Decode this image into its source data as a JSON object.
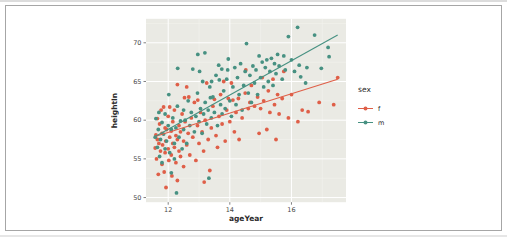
{
  "figure": {
    "border_color": "#a6a6a6",
    "background": "#ffffff"
  },
  "chart_data": {
    "type": "scatter",
    "title": "",
    "xlabel": "ageYear",
    "ylabel": "heightIn",
    "xlim": [
      11.28,
      17.77
    ],
    "ylim": [
      49.4,
      73.1
    ],
    "x_ticks": [
      12,
      14,
      16
    ],
    "y_ticks": [
      50,
      55,
      60,
      65,
      70
    ],
    "x_minor_ticks": [
      13,
      15,
      17
    ],
    "y_minor_ticks": [
      52.5,
      57.5,
      62.5,
      67.5,
      72.5
    ],
    "grid": true,
    "panel_bg": "#eaeae4",
    "grid_major_color": "#ffffff",
    "grid_minor_color": "#f4f4ef",
    "legend": {
      "title": "sex",
      "position": "right",
      "entries": [
        {
          "label": "f",
          "color": "#df5f48"
        },
        {
          "label": "m",
          "color": "#479182"
        }
      ]
    },
    "series": [
      {
        "name": "f",
        "color": "#df5f48",
        "fit_line": {
          "x": [
            11.58,
            17.5
          ],
          "y": [
            57.9,
            65.3
          ]
        },
        "points": [
          [
            11.58,
            56.4
          ],
          [
            11.6,
            58.1
          ],
          [
            11.62,
            55.0
          ],
          [
            11.65,
            57.5
          ],
          [
            11.65,
            60.2
          ],
          [
            11.68,
            53.0
          ],
          [
            11.7,
            57.0
          ],
          [
            11.72,
            59.5
          ],
          [
            11.75,
            56.0
          ],
          [
            11.77,
            61.3
          ],
          [
            11.8,
            54.3
          ],
          [
            11.8,
            58.3
          ],
          [
            11.82,
            56.8
          ],
          [
            11.85,
            61.7
          ],
          [
            11.87,
            53.3
          ],
          [
            11.9,
            55.8
          ],
          [
            11.9,
            59.0
          ],
          [
            11.92,
            57.3
          ],
          [
            11.93,
            51.3
          ],
          [
            11.95,
            58.8
          ],
          [
            12.0,
            56.3
          ],
          [
            12.0,
            60.5
          ],
          [
            12.02,
            54.8
          ],
          [
            12.05,
            57.8
          ],
          [
            12.05,
            61.7
          ],
          [
            12.1,
            55.5
          ],
          [
            12.1,
            58.6
          ],
          [
            12.12,
            52.8
          ],
          [
            12.15,
            57.0
          ],
          [
            12.15,
            59.8
          ],
          [
            12.2,
            56.5
          ],
          [
            12.2,
            61.3
          ],
          [
            12.25,
            54.5
          ],
          [
            12.25,
            58.0
          ],
          [
            12.3,
            52.2
          ],
          [
            12.3,
            57.5
          ],
          [
            12.3,
            64.6
          ],
          [
            12.35,
            56.0
          ],
          [
            12.35,
            59.3
          ],
          [
            12.4,
            55.3
          ],
          [
            12.4,
            58.5
          ],
          [
            12.45,
            60.8
          ],
          [
            12.5,
            54.0
          ],
          [
            12.5,
            57.3
          ],
          [
            12.53,
            62.9
          ],
          [
            12.55,
            59.8
          ],
          [
            12.6,
            56.8
          ],
          [
            12.6,
            64.3
          ],
          [
            12.65,
            58.3
          ],
          [
            12.67,
            63.0
          ],
          [
            12.7,
            55.5
          ],
          [
            12.75,
            60.3
          ],
          [
            12.8,
            57.8
          ],
          [
            12.85,
            62.3
          ],
          [
            12.9,
            54.8
          ],
          [
            12.95,
            59.3
          ],
          [
            12.96,
            62.6
          ],
          [
            13.0,
            57.0
          ],
          [
            13.05,
            61.0
          ],
          [
            13.1,
            58.5
          ],
          [
            13.15,
            56.0
          ],
          [
            13.17,
            52.0
          ],
          [
            13.2,
            60.0
          ],
          [
            13.25,
            64.8
          ],
          [
            13.3,
            57.5
          ],
          [
            13.35,
            53.5
          ],
          [
            13.4,
            59.0
          ],
          [
            13.45,
            61.8
          ],
          [
            13.5,
            62.7
          ],
          [
            13.55,
            58.0
          ],
          [
            13.6,
            56.5
          ],
          [
            13.65,
            60.5
          ],
          [
            13.7,
            63.3
          ],
          [
            13.75,
            59.5
          ],
          [
            13.8,
            65.0
          ],
          [
            13.85,
            57.3
          ],
          [
            13.9,
            61.3
          ],
          [
            13.95,
            62.8
          ],
          [
            14.0,
            59.8
          ],
          [
            14.05,
            64.8
          ],
          [
            14.1,
            62.6
          ],
          [
            14.15,
            58.5
          ],
          [
            14.2,
            61.0
          ],
          [
            14.28,
            62.8
          ],
          [
            14.3,
            57.5
          ],
          [
            14.4,
            60.3
          ],
          [
            14.5,
            63.5
          ],
          [
            14.52,
            66.5
          ],
          [
            14.6,
            61.5
          ],
          [
            14.65,
            62.3
          ],
          [
            14.7,
            64.5
          ],
          [
            14.8,
            61.8
          ],
          [
            14.9,
            63.0
          ],
          [
            14.95,
            58.3
          ],
          [
            15.0,
            61.5
          ],
          [
            15.05,
            65.5
          ],
          [
            15.1,
            62.5
          ],
          [
            15.2,
            58.8
          ],
          [
            15.25,
            63.8
          ],
          [
            15.3,
            61.0
          ],
          [
            15.4,
            65.3
          ],
          [
            15.45,
            62.0
          ],
          [
            15.5,
            57.5
          ],
          [
            15.55,
            63.3
          ],
          [
            15.6,
            60.8
          ],
          [
            15.7,
            62.8
          ],
          [
            15.75,
            66.3
          ],
          [
            15.9,
            60.3
          ],
          [
            16.0,
            63.3
          ],
          [
            16.21,
            59.8
          ],
          [
            16.35,
            61.3
          ],
          [
            16.54,
            61.1
          ],
          [
            16.9,
            62.3
          ],
          [
            17.37,
            62.0
          ],
          [
            17.5,
            65.5
          ]
        ]
      },
      {
        "name": "m",
        "color": "#479182",
        "fit_line": {
          "x": [
            11.58,
            17.5
          ],
          "y": [
            57.9,
            71.0
          ]
        },
        "points": [
          [
            11.58,
            57.8
          ],
          [
            11.6,
            60.2
          ],
          [
            11.65,
            56.5
          ],
          [
            11.68,
            58.8
          ],
          [
            11.7,
            61.0
          ],
          [
            11.72,
            55.3
          ],
          [
            11.75,
            57.5
          ],
          [
            11.8,
            59.7
          ],
          [
            11.8,
            54.5
          ],
          [
            11.85,
            58.2
          ],
          [
            11.9,
            56.3
          ],
          [
            11.9,
            60.8
          ],
          [
            11.95,
            57.3
          ],
          [
            12.0,
            59.3
          ],
          [
            12.02,
            63.3
          ],
          [
            12.05,
            55.8
          ],
          [
            12.1,
            58.8
          ],
          [
            12.1,
            53.2
          ],
          [
            12.15,
            60.3
          ],
          [
            12.2,
            57.0
          ],
          [
            12.2,
            55.0
          ],
          [
            12.25,
            59.0
          ],
          [
            12.27,
            50.6
          ],
          [
            12.3,
            61.8
          ],
          [
            12.31,
            66.7
          ],
          [
            12.35,
            57.8
          ],
          [
            12.4,
            59.9
          ],
          [
            12.45,
            56.3
          ],
          [
            12.5,
            58.8
          ],
          [
            12.5,
            61.3
          ],
          [
            12.55,
            60.0
          ],
          [
            12.6,
            57.0
          ],
          [
            12.65,
            62.5
          ],
          [
            12.7,
            59.3
          ],
          [
            12.75,
            61.0
          ],
          [
            12.8,
            66.6
          ],
          [
            12.85,
            58.5
          ],
          [
            12.9,
            60.5
          ],
          [
            12.95,
            63.5
          ],
          [
            12.96,
            68.5
          ],
          [
            13.0,
            59.8
          ],
          [
            13.02,
            66.3
          ],
          [
            13.05,
            61.5
          ],
          [
            13.1,
            58.3
          ],
          [
            13.12,
            65.0
          ],
          [
            13.15,
            60.8
          ],
          [
            13.19,
            68.7
          ],
          [
            13.2,
            62.3
          ],
          [
            13.25,
            59.5
          ],
          [
            13.3,
            61.3
          ],
          [
            13.32,
            52.5
          ],
          [
            13.35,
            64.3
          ],
          [
            13.37,
            62.9
          ],
          [
            13.4,
            60.3
          ],
          [
            13.41,
            65.0
          ],
          [
            13.45,
            63.0
          ],
          [
            13.5,
            61.0
          ],
          [
            13.55,
            65.8
          ],
          [
            13.6,
            59.3
          ],
          [
            13.64,
            67.1
          ],
          [
            13.66,
            65.2
          ],
          [
            13.7,
            62.0
          ],
          [
            13.74,
            66.6
          ],
          [
            13.75,
            60.8
          ],
          [
            13.8,
            63.8
          ],
          [
            13.85,
            61.5
          ],
          [
            13.9,
            65.3
          ],
          [
            13.93,
            66.5
          ],
          [
            13.95,
            67.9
          ],
          [
            14.0,
            62.5
          ],
          [
            14.05,
            60.5
          ],
          [
            14.1,
            64.3
          ],
          [
            14.16,
            66.8
          ],
          [
            14.2,
            62.0
          ],
          [
            14.25,
            65.5
          ],
          [
            14.3,
            63.3
          ],
          [
            14.35,
            67.3
          ],
          [
            14.4,
            61.3
          ],
          [
            14.45,
            64.5
          ],
          [
            14.5,
            66.3
          ],
          [
            14.54,
            69.9
          ],
          [
            14.6,
            63.5
          ],
          [
            14.65,
            65.8
          ],
          [
            14.7,
            62.3
          ],
          [
            14.75,
            67.0
          ],
          [
            14.8,
            64.8
          ],
          [
            14.85,
            66.5
          ],
          [
            14.9,
            63.3
          ],
          [
            14.95,
            68.3
          ],
          [
            15.0,
            65.5
          ],
          [
            15.05,
            67.5
          ],
          [
            15.1,
            64.3
          ],
          [
            15.15,
            66.8
          ],
          [
            15.2,
            67.8
          ],
          [
            15.25,
            65.0
          ],
          [
            15.3,
            66.3
          ],
          [
            15.35,
            68.0
          ],
          [
            15.4,
            64.5
          ],
          [
            15.45,
            67.3
          ],
          [
            15.5,
            66.0
          ],
          [
            15.55,
            68.5
          ],
          [
            15.6,
            67.0
          ],
          [
            15.7,
            65.3
          ],
          [
            15.75,
            68.3
          ],
          [
            15.8,
            66.5
          ],
          [
            15.9,
            70.8
          ],
          [
            16.0,
            67.8
          ],
          [
            16.1,
            66.3
          ],
          [
            16.2,
            72.0
          ],
          [
            16.25,
            67.1
          ],
          [
            16.3,
            65.6
          ],
          [
            16.46,
            64.8
          ],
          [
            16.5,
            66.8
          ],
          [
            16.75,
            71.0
          ],
          [
            16.97,
            66.7
          ],
          [
            17.19,
            69.4
          ],
          [
            17.22,
            68.2
          ]
        ]
      }
    ]
  }
}
